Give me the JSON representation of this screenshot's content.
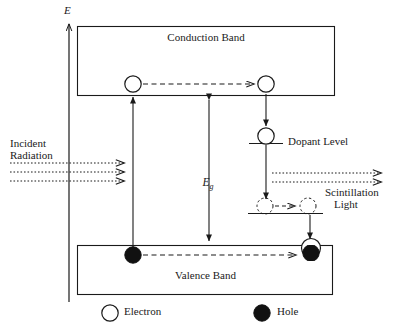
{
  "figure": {
    "type": "energy-band-scintillation-diagram",
    "axis": {
      "label": "E",
      "meaning": "energy-axis-upward"
    },
    "bands": {
      "conduction": {
        "label": "Conduction Band"
      },
      "valence": {
        "label": "Valence Band"
      }
    },
    "levels": {
      "dopant": {
        "label": "Dopant Level"
      }
    },
    "gap": {
      "label": "E",
      "subscript": "g"
    },
    "inputs": {
      "incident_radiation": {
        "line1": "Incident",
        "line2": "Radiation",
        "ray_count": 3
      }
    },
    "outputs": {
      "scintillation": {
        "line1": "Scintillation",
        "line2": "Light",
        "ray_count": 2
      }
    },
    "legend": [
      {
        "symbol": "open-circle",
        "label": "Electron"
      },
      {
        "symbol": "filled-circle",
        "label": "Hole"
      }
    ],
    "colors": {
      "stroke": "#1a1a1a",
      "fill_hole": "#111111",
      "fill_electron": "#ffffff",
      "background": "#ffffff"
    }
  }
}
